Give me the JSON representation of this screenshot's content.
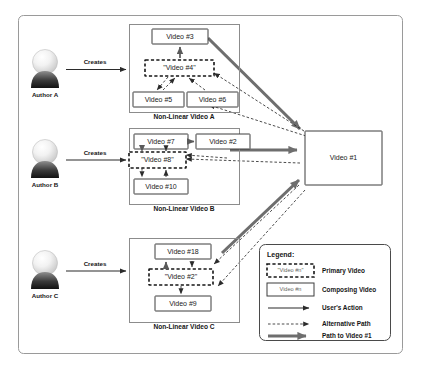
{
  "diagram": {
    "authors": [
      {
        "id": "author-a",
        "label": "Author A",
        "action": "Creates"
      },
      {
        "id": "author-b",
        "label": "Author B",
        "action": "Creates"
      },
      {
        "id": "author-c",
        "label": "Author C",
        "action": "Creates"
      }
    ],
    "groups": [
      {
        "id": "group-a",
        "caption": "Non-Linear Video A",
        "nodes": [
          {
            "id": "video-3",
            "label": "Video #3",
            "type": "composing"
          },
          {
            "id": "video-4",
            "label": "\"Video #4\"",
            "type": "primary"
          },
          {
            "id": "video-5",
            "label": "Video #5",
            "type": "composing"
          },
          {
            "id": "video-6",
            "label": "Video #6",
            "type": "composing"
          }
        ]
      },
      {
        "id": "group-b",
        "caption": "Non-Linear Video B",
        "nodes": [
          {
            "id": "video-7",
            "label": "Video #7",
            "type": "composing"
          },
          {
            "id": "video-2b",
            "label": "Video #2",
            "type": "composing"
          },
          {
            "id": "video-8",
            "label": "\"Video #8\"",
            "type": "primary"
          },
          {
            "id": "video-10",
            "label": "Video #10",
            "type": "composing"
          }
        ]
      },
      {
        "id": "group-c",
        "caption": "Non-Linear Video C",
        "nodes": [
          {
            "id": "video-18",
            "label": "Video #18",
            "type": "composing"
          },
          {
            "id": "video-2c",
            "label": "\"Video #2\"",
            "type": "primary"
          },
          {
            "id": "video-9",
            "label": "Video #9",
            "type": "composing"
          }
        ]
      }
    ],
    "hub": {
      "id": "video-1",
      "label": "Video #1",
      "type": "composing"
    },
    "legend": {
      "title": "Legend:",
      "items": [
        {
          "id": "legend-primary",
          "sample": "primary-box",
          "chip_label": "\"Video #n\"",
          "label": "Primary Video"
        },
        {
          "id": "legend-composing",
          "sample": "composing-box",
          "chip_label": "Video #n",
          "label": "Composing Video"
        },
        {
          "id": "legend-user-action",
          "sample": "solid-arrow",
          "chip_label": "",
          "label": "User's Action"
        },
        {
          "id": "legend-alternative-path",
          "sample": "dashed-arrow",
          "chip_label": "",
          "label": "Alternative Path"
        },
        {
          "id": "legend-path-to-video1",
          "sample": "thick-arrow",
          "chip_label": "",
          "label": "Path to Video #1"
        }
      ]
    },
    "colors": {
      "frame": "#9a9a9a",
      "group": "#8c8c8c",
      "node_stroke": "#3c3c3c",
      "primary_stroke": "#161616",
      "edge": "#2b2b2b",
      "thick_edge": "#6e6e6e",
      "background": "#ffffff"
    }
  }
}
